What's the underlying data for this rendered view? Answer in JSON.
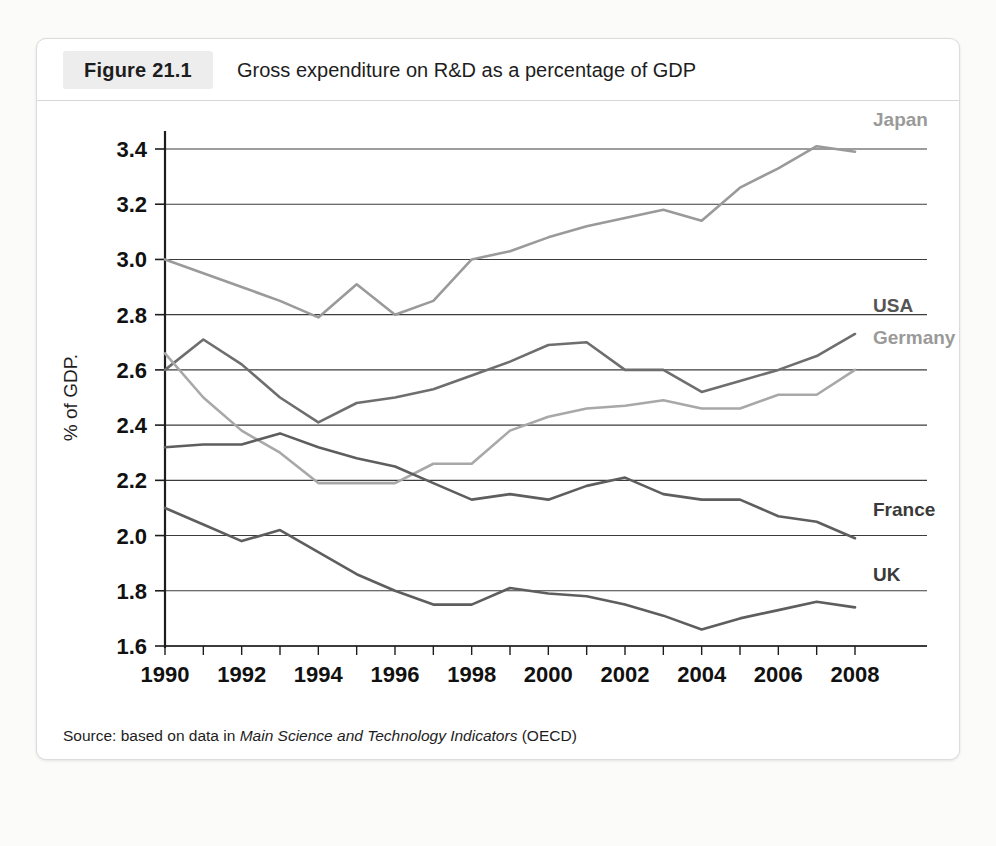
{
  "figure": {
    "number": "Figure 21.1",
    "title": "Gross expenditure on R&D as a percentage of GDP",
    "source_prefix": "Source: based on data in ",
    "source_italic": "Main Science and Technology Indicators",
    "source_suffix": " (OECD)"
  },
  "chart_data": {
    "type": "line",
    "title": "Gross expenditure on R&D as a percentage of GDP",
    "xlabel": "",
    "ylabel": "% of GDP.",
    "xlim": [
      1990,
      2008
    ],
    "ylim": [
      1.6,
      3.4
    ],
    "ytick_step": 0.2,
    "grid": true,
    "legend": "inline-right-labels",
    "x": [
      1990,
      1991,
      1992,
      1993,
      1994,
      1995,
      1996,
      1997,
      1998,
      1999,
      2000,
      2001,
      2002,
      2003,
      2004,
      2005,
      2006,
      2007,
      2008
    ],
    "xticklabels": [
      "1990",
      "1992",
      "1994",
      "1996",
      "1998",
      "2000",
      "2002",
      "2004",
      "2006",
      "2008"
    ],
    "yticklabels": [
      "1.6",
      "1.8",
      "2.0",
      "2.2",
      "2.4",
      "2.6",
      "2.8",
      "3.0",
      "3.2",
      "3.4"
    ],
    "series": [
      {
        "name": "Japan",
        "color": "#9a9a9a",
        "label_color": "#9a9a9a",
        "values": [
          3.0,
          2.95,
          2.9,
          2.85,
          2.79,
          2.91,
          2.8,
          2.85,
          3.0,
          3.03,
          3.08,
          3.12,
          3.15,
          3.18,
          3.14,
          3.26,
          3.33,
          3.41,
          3.39
        ]
      },
      {
        "name": "USA",
        "color": "#6e6e6e",
        "label_color": "#555555",
        "values": [
          2.6,
          2.71,
          2.62,
          2.5,
          2.41,
          2.48,
          2.5,
          2.53,
          2.58,
          2.63,
          2.69,
          2.7,
          2.6,
          2.6,
          2.52,
          2.56,
          2.6,
          2.65,
          2.73
        ]
      },
      {
        "name": "Germany",
        "color": "#a8a8a8",
        "label_color": "#9a9a9a",
        "values": [
          2.66,
          2.5,
          2.38,
          2.3,
          2.19,
          2.19,
          2.19,
          2.26,
          2.26,
          2.38,
          2.43,
          2.46,
          2.47,
          2.49,
          2.46,
          2.46,
          2.51,
          2.51,
          2.6
        ]
      },
      {
        "name": "France",
        "color": "#5e5e5e",
        "label_color": "#3a3a3a",
        "values": [
          2.32,
          2.33,
          2.33,
          2.37,
          2.32,
          2.28,
          2.25,
          2.19,
          2.13,
          2.15,
          2.13,
          2.18,
          2.21,
          2.15,
          2.13,
          2.13,
          2.07,
          2.05,
          1.99
        ]
      },
      {
        "name": "UK",
        "color": "#5e5e5e",
        "label_color": "#3a3a3a",
        "values": [
          2.1,
          2.04,
          1.98,
          2.02,
          1.94,
          1.86,
          1.8,
          1.75,
          1.75,
          1.81,
          1.79,
          1.78,
          1.75,
          1.71,
          1.66,
          1.7,
          1.73,
          1.76,
          1.74
        ]
      }
    ]
  }
}
